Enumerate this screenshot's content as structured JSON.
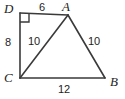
{
  "figure": {
    "type": "geometry-diagram",
    "background_color": "#ffffff",
    "stroke_color": "#3a3a3a",
    "text_color": "#1d1d1d",
    "vertices": [
      {
        "id": "D",
        "label": "D",
        "x": 20,
        "y": 13
      },
      {
        "id": "A",
        "label": "A",
        "x": 68,
        "y": 15
      },
      {
        "id": "B",
        "label": "B",
        "x": 105,
        "y": 78
      },
      {
        "id": "C",
        "label": "C",
        "x": 20,
        "y": 78
      }
    ],
    "segments": [
      {
        "id": "DA",
        "from": "D",
        "to": "A",
        "length_label": "6"
      },
      {
        "id": "DC",
        "from": "D",
        "to": "C",
        "length_label": "8"
      },
      {
        "id": "CA",
        "from": "C",
        "to": "A",
        "length_label": "10"
      },
      {
        "id": "AB",
        "from": "A",
        "to": "B",
        "length_label": "10"
      },
      {
        "id": "CB",
        "from": "C",
        "to": "B",
        "length_label": "12"
      }
    ],
    "angle_markers": [
      {
        "id": "right-angle-D",
        "at": "D",
        "type": "right-angle",
        "size": 9
      }
    ]
  }
}
